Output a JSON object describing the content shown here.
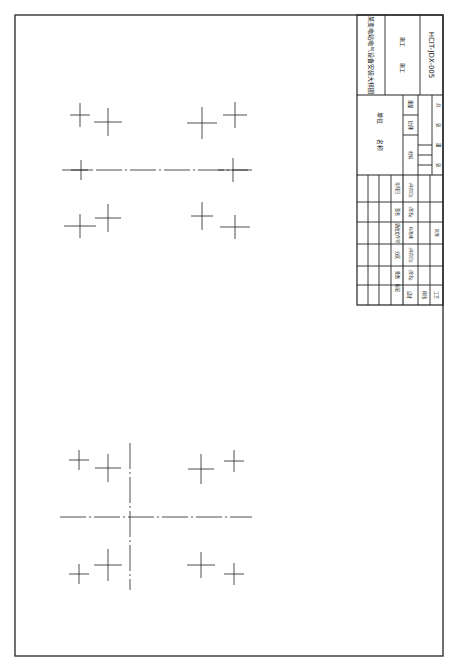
{
  "drawing": {
    "title": "某变电站电气设备安装大样图",
    "drawing_no": "HCIT-JDX-005",
    "stage_label": "施工",
    "scale_label": "比例",
    "material_label": "材料",
    "weight_label": "重量",
    "units_label": "单位名称",
    "sheet_labels": [
      "共",
      "张",
      "第",
      "张"
    ]
  },
  "title_block": {
    "revision_headers": [
      "标记",
      "处数",
      "分区",
      "更改文件号",
      "签名",
      "年月日"
    ],
    "sign_rows": [
      "设计",
      "审核",
      "工艺"
    ],
    "sign_cols": [
      "(签名)",
      "(年月日)",
      "标准化",
      "(签名)",
      "(年月日)",
      "批准"
    ]
  },
  "crosses_top": [
    {
      "x": 80,
      "y": 115,
      "h": 20,
      "v": 24
    },
    {
      "x": 108,
      "y": 122,
      "h": 28,
      "v": 28
    },
    {
      "x": 202,
      "y": 123,
      "h": 30,
      "v": 32
    },
    {
      "x": 235,
      "y": 115,
      "h": 24,
      "v": 26
    },
    {
      "x": 81,
      "y": 170,
      "h": 20,
      "v": 20
    },
    {
      "x": 233,
      "y": 170,
      "h": 30,
      "v": 24
    },
    {
      "x": 80,
      "y": 226,
      "h": 32,
      "v": 24
    },
    {
      "x": 108,
      "y": 218,
      "h": 26,
      "v": 28
    },
    {
      "x": 202,
      "y": 216,
      "h": 22,
      "v": 28
    },
    {
      "x": 235,
      "y": 227,
      "h": 30,
      "v": 24
    }
  ],
  "crosses_bottom": [
    {
      "x": 79,
      "y": 460,
      "h": 20,
      "v": 20
    },
    {
      "x": 108,
      "y": 468,
      "h": 26,
      "v": 28
    },
    {
      "x": 201,
      "y": 469,
      "h": 26,
      "v": 30
    },
    {
      "x": 234,
      "y": 461,
      "h": 20,
      "v": 22
    },
    {
      "x": 79,
      "y": 574,
      "h": 20,
      "v": 20
    },
    {
      "x": 108,
      "y": 565,
      "h": 28,
      "v": 32
    },
    {
      "x": 201,
      "y": 565,
      "h": 28,
      "v": 26
    },
    {
      "x": 234,
      "y": 574,
      "h": 20,
      "v": 22
    }
  ],
  "centerlines": {
    "top_h": {
      "x1": 62,
      "y": 170,
      "x2": 252
    },
    "bottom_h": {
      "x1": 60,
      "y": 517,
      "x2": 252
    },
    "bottom_v": {
      "x": 130,
      "y1": 443,
      "y2": 590
    }
  },
  "colors": {
    "line": "#222222",
    "border": "#333333",
    "paper": "#ffffff"
  }
}
